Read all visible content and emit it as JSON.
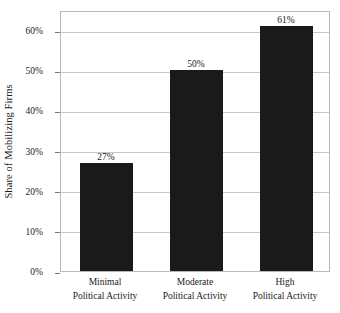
{
  "chart_data": {
    "type": "bar",
    "title": "",
    "xlabel": "",
    "ylabel": "Share of Mobilizing Firms",
    "ylim": [
      0,
      65
    ],
    "grid": true,
    "legend": false,
    "categories": [
      "Minimal Political Activity",
      "Moderate Political Activity",
      "High Political Activity"
    ],
    "category_lines": [
      {
        "line1": "Minimal",
        "line2": "Political Activity"
      },
      {
        "line1": "Moderate",
        "line2": "Political Activity"
      },
      {
        "line1": "High",
        "line2": "Political Activity"
      }
    ],
    "values": [
      27,
      50,
      61
    ],
    "data_labels": [
      "27%",
      "50%",
      "61%"
    ],
    "y_ticks": [
      0,
      10,
      20,
      30,
      40,
      50,
      60
    ],
    "y_tick_labels": [
      "0%",
      "10%",
      "20%",
      "30%",
      "40%",
      "50%",
      "60%"
    ],
    "colors": {
      "bar": "#1a1a1a",
      "grid": "#c8c8c8",
      "frame": "#b9b9b9",
      "background": "#ffffff",
      "text": "#1a1a1a"
    }
  }
}
